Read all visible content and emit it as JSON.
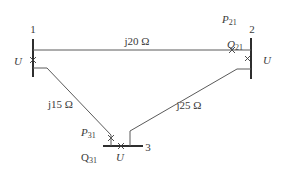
{
  "diagram": {
    "type": "three-bus power network",
    "buses": [
      {
        "id": "bus-1",
        "number": "1",
        "voltage_label": "U"
      },
      {
        "id": "bus-2",
        "number": "2",
        "voltage_label": "U",
        "p_label": "P",
        "p_sub": "21",
        "q_label": "Q",
        "q_sub": "21"
      },
      {
        "id": "bus-3",
        "number": "3",
        "voltage_label": "U",
        "p_label": "P",
        "p_sub": "31",
        "q_label": "Q",
        "q_sub": "31"
      }
    ],
    "lines": [
      {
        "id": "line-1-2",
        "impedance": "j20 Ω"
      },
      {
        "id": "line-1-3",
        "impedance": "j15 Ω"
      },
      {
        "id": "line-2-3",
        "impedance": "j25 Ω"
      }
    ],
    "colors": {
      "ink": "#3a3a3a",
      "wire": "#5a5a5a",
      "bus": "#2e2e2e",
      "background": "#ffffff"
    }
  }
}
